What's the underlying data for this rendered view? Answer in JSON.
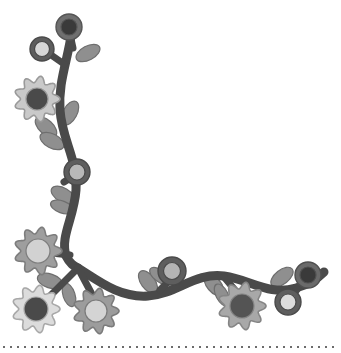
{
  "artwork": {
    "title": "Floral Corner Border Ornament",
    "width": 341,
    "height": 353,
    "background_color": "#ffffff",
    "style": "grayscale decorative vine with flowers and leaves forming a left-and-bottom corner frame"
  },
  "palette": {
    "background": "#ffffff",
    "vine_dark": "#4a4a4a",
    "vine_outline": "#3c3c3c",
    "leaf_gray": "#8f8f8f",
    "leaf_outline": "#6e6e6e",
    "petal_light": "#d8d8d8",
    "petal_mid": "#b4b4b4",
    "petal_dark": "#8c8c8c",
    "center_darkest": "#3a3a3a",
    "center_dark": "#555555",
    "center_light": "#dcdcdc",
    "center_mid": "#aaaaaa",
    "ring_dark": "#5a5a5a",
    "outline": "#707070",
    "dotted_border": "#6b6b6b"
  },
  "vine": {
    "name": "main-vine-stem",
    "stroke_width": 9,
    "color": "#4a4a4a",
    "junction_point": {
      "x": 78,
      "y": 268
    },
    "vertical_path": "M 72 30 C 68 60, 58 82, 60 110 C 62 140, 78 160, 76 190 C 74 218, 60 236, 66 256 C 70 264, 74 266, 78 268",
    "horizontal_path": "M 78 268 C 100 282, 120 298, 148 296 C 176 294, 196 272, 224 276 C 252 280, 268 296, 296 288 C 310 284, 318 278, 324 272"
  },
  "flowers": [
    {
      "id": "flower-top-dark-ring",
      "name": "ring-flower-top",
      "type": "ring",
      "cx": 69,
      "cy": 27,
      "r": 13,
      "ring_color": "#6f6f6f",
      "center_color": "#3a3a3a",
      "center_r": 8,
      "outline": "#555555"
    },
    {
      "id": "flower-upper-left-light-ring",
      "name": "ring-flower-upper-left",
      "type": "ring",
      "cx": 42,
      "cy": 49,
      "r": 12,
      "ring_color": "#5e5e5e",
      "center_color": "#d8d8d8",
      "center_r": 7.5,
      "outline": "#4a4a4a"
    },
    {
      "id": "flower-left-lobed-dark-center",
      "name": "lobed-flower-left-upper",
      "type": "lobed",
      "cx": 37,
      "cy": 99,
      "r": 23,
      "petal_color": "#c9c9c9",
      "center_color": "#4a4a4a",
      "center_r": 11,
      "lobes": 9,
      "outline": "#9a9a9a"
    },
    {
      "id": "flower-mid-stem-ring",
      "name": "ring-flower-mid-stem",
      "type": "ring",
      "cx": 77,
      "cy": 172,
      "r": 13,
      "ring_color": "#5e5e5e",
      "center_color": "#b8b8b8",
      "center_r": 8,
      "outline": "#4a4a4a"
    },
    {
      "id": "flower-left-lobed-light-center",
      "name": "lobed-flower-left-lower",
      "type": "lobed",
      "cx": 38,
      "cy": 251,
      "r": 24,
      "petal_color": "#9e9e9e",
      "center_color": "#d2d2d2",
      "center_r": 12,
      "lobes": 9,
      "outline": "#7d7d7d"
    },
    {
      "id": "flower-bottom-left-lobed",
      "name": "lobed-flower-bottom-left",
      "type": "lobed",
      "cx": 36,
      "cy": 309,
      "r": 24,
      "petal_color": "#dcdcdc",
      "center_color": "#4a4a4a",
      "center_r": 12,
      "lobes": 9,
      "outline": "#a8a8a8"
    },
    {
      "id": "flower-bottom-second-lobed",
      "name": "lobed-flower-bottom-second",
      "type": "lobed",
      "cx": 96,
      "cy": 311,
      "r": 23,
      "petal_color": "#9c9c9c",
      "center_color": "#d4d4d4",
      "center_r": 11,
      "lobes": 9,
      "outline": "#7b7b7b"
    },
    {
      "id": "flower-center-bottom-ring",
      "name": "ring-flower-center-bottom",
      "type": "ring",
      "cx": 172,
      "cy": 271,
      "r": 14,
      "ring_color": "#5e5e5e",
      "center_color": "#b4b4b4",
      "center_r": 8.5,
      "outline": "#4a4a4a"
    },
    {
      "id": "flower-right-lobed",
      "name": "lobed-flower-right",
      "type": "lobed",
      "cx": 242,
      "cy": 306,
      "r": 24,
      "petal_color": "#a8a8a8",
      "center_color": "#545454",
      "center_r": 12,
      "lobes": 9,
      "outline": "#858585"
    },
    {
      "id": "flower-far-right-dark-ring",
      "name": "ring-flower-far-right-upper",
      "type": "ring",
      "cx": 308,
      "cy": 275,
      "r": 13,
      "ring_color": "#6a6a6a",
      "center_color": "#3a3a3a",
      "center_r": 8,
      "outline": "#505050"
    },
    {
      "id": "flower-far-right-light-ring",
      "name": "ring-flower-far-right-lower",
      "type": "ring",
      "cx": 288,
      "cy": 302,
      "r": 13,
      "ring_color": "#5e5e5e",
      "center_color": "#dcdcdc",
      "center_r": 8,
      "outline": "#4a4a4a"
    }
  ],
  "leaves": [
    {
      "name": "leaf-top-right",
      "cx": 88,
      "cy": 53,
      "rx": 13,
      "ry": 7,
      "rotate": -28,
      "color": "#8f8f8f"
    },
    {
      "name": "leaf-upper-left-1",
      "cx": 46,
      "cy": 127,
      "rx": 13,
      "ry": 7,
      "rotate": 42,
      "color": "#8f8f8f"
    },
    {
      "name": "leaf-upper-left-2",
      "cx": 52,
      "cy": 141,
      "rx": 13,
      "ry": 7,
      "rotate": 28,
      "color": "#8f8f8f"
    },
    {
      "name": "leaf-upper-right",
      "cx": 70,
      "cy": 113,
      "rx": 13,
      "ry": 7,
      "rotate": -62,
      "color": "#8f8f8f"
    },
    {
      "name": "leaf-mid-left-1",
      "cx": 63,
      "cy": 195,
      "rx": 13,
      "ry": 7,
      "rotate": 30,
      "color": "#8f8f8f"
    },
    {
      "name": "leaf-mid-left-2",
      "cx": 62,
      "cy": 207,
      "rx": 12,
      "ry": 6,
      "rotate": 20,
      "color": "#8f8f8f"
    },
    {
      "name": "leaf-junction-left",
      "cx": 50,
      "cy": 281,
      "rx": 13,
      "ry": 7,
      "rotate": 18,
      "color": "#8f8f8f"
    },
    {
      "name": "leaf-junction-down",
      "cx": 69,
      "cy": 295,
      "rx": 12,
      "ry": 6,
      "rotate": 72,
      "color": "#8f8f8f"
    },
    {
      "name": "leaf-center-left",
      "cx": 148,
      "cy": 282,
      "rx": 13,
      "ry": 7,
      "rotate": 54,
      "color": "#8f8f8f"
    },
    {
      "name": "leaf-center-right",
      "cx": 160,
      "cy": 276,
      "rx": 12,
      "ry": 6,
      "rotate": 36,
      "color": "#8f8f8f"
    },
    {
      "name": "leaf-right-1",
      "cx": 214,
      "cy": 285,
      "rx": 13,
      "ry": 7,
      "rotate": 50,
      "color": "#8f8f8f"
    },
    {
      "name": "leaf-right-2",
      "cx": 222,
      "cy": 295,
      "rx": 12,
      "ry": 6,
      "rotate": 62,
      "color": "#8f8f8f"
    },
    {
      "name": "leaf-far-right",
      "cx": 282,
      "cy": 277,
      "rx": 13,
      "ry": 7,
      "rotate": -38,
      "color": "#8f8f8f"
    }
  ],
  "dotted_border": {
    "name": "bottom-dotted-rule",
    "y": 346,
    "x_start": 3,
    "x_end": 338,
    "dot_size": 2,
    "spacing": 7,
    "color": "#6b6b6b"
  }
}
